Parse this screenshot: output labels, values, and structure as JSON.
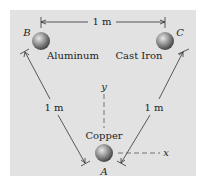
{
  "diagram": {
    "top_dimension": "1 m",
    "left_dimension": "1 m",
    "right_dimension": "1 m",
    "spheres": [
      {
        "point": "A",
        "material": "Copper"
      },
      {
        "point": "B",
        "material": "Aluminum"
      },
      {
        "point": "C",
        "material": "Cast Iron"
      }
    ],
    "axes": {
      "x": "x",
      "y": "y"
    },
    "colors": {
      "panel": "#e2e2e2",
      "line": "#333333",
      "sphere": "#8a8a8a"
    }
  }
}
